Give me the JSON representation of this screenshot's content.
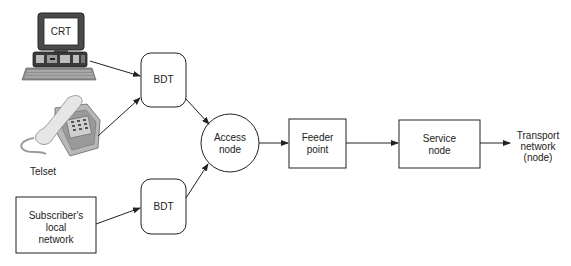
{
  "diagram": {
    "nodes": {
      "crt": {
        "label": "CRT",
        "icon": "computer-terminal-icon"
      },
      "telset": {
        "label": "Telset",
        "icon": "telephone-icon"
      },
      "subscriber": {
        "line1": "Subscriber's",
        "line2": "local",
        "line3": "network"
      },
      "bdt_top": {
        "label": "BDT"
      },
      "bdt_bottom": {
        "label": "BDT"
      },
      "access": {
        "line1": "Access",
        "line2": "node"
      },
      "feeder": {
        "line1": "Feeder",
        "line2": "point"
      },
      "service": {
        "line1": "Service",
        "line2": "node"
      },
      "transport": {
        "line1": "Transport",
        "line2": "network",
        "line3": "(node)"
      }
    },
    "edges": [
      [
        "crt",
        "bdt_top"
      ],
      [
        "telset",
        "bdt_top"
      ],
      [
        "subscriber",
        "bdt_bottom"
      ],
      [
        "bdt_top",
        "access"
      ],
      [
        "bdt_bottom",
        "access"
      ],
      [
        "access",
        "feeder"
      ],
      [
        "feeder",
        "service"
      ],
      [
        "service",
        "transport"
      ]
    ],
    "colors": {
      "stroke": "#222222",
      "fill": "#ffffff",
      "device_gray": "#bdbdbd",
      "device_dark": "#4a4a4a"
    }
  }
}
